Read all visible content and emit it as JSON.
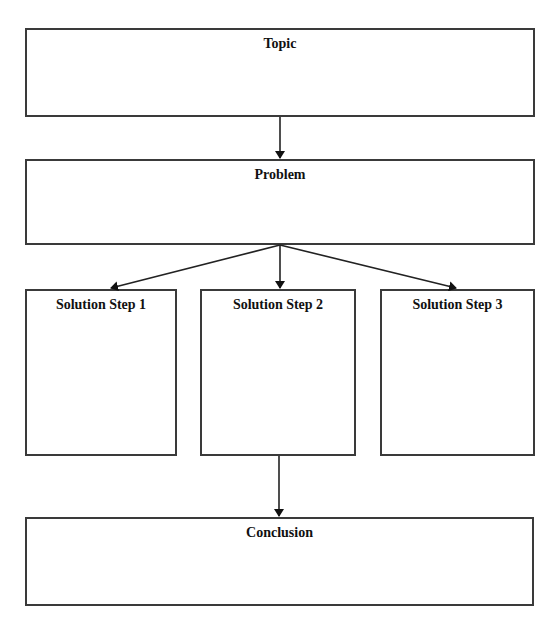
{
  "diagram": {
    "type": "flowchart",
    "colors": {
      "stroke": "#3a3a3a",
      "text": "#111111",
      "background": "#ffffff"
    },
    "nodes": [
      {
        "id": "topic",
        "label": "Topic",
        "x": 25,
        "y": 28,
        "w": 510,
        "h": 89
      },
      {
        "id": "problem",
        "label": "Problem",
        "x": 25,
        "y": 159,
        "w": 510,
        "h": 86
      },
      {
        "id": "step1",
        "label": "Solution Step 1",
        "x": 25,
        "y": 289,
        "w": 152,
        "h": 167
      },
      {
        "id": "step2",
        "label": "Solution Step 2",
        "x": 200,
        "y": 289,
        "w": 156,
        "h": 167
      },
      {
        "id": "step3",
        "label": "Solution Step 3",
        "x": 380,
        "y": 289,
        "w": 155,
        "h": 167
      },
      {
        "id": "conclusion",
        "label": "Conclusion",
        "x": 25,
        "y": 517,
        "w": 509,
        "h": 89
      }
    ],
    "edges": [
      {
        "from": "topic",
        "to": "problem",
        "x1": 280,
        "y1": 117,
        "x2": 280,
        "y2": 158
      },
      {
        "from": "problem",
        "to": "step1",
        "x1": 280,
        "y1": 245,
        "x2": 111,
        "y2": 288
      },
      {
        "from": "problem",
        "to": "step2",
        "x1": 280,
        "y1": 245,
        "x2": 280,
        "y2": 288
      },
      {
        "from": "problem",
        "to": "step3",
        "x1": 280,
        "y1": 245,
        "x2": 456,
        "y2": 288
      },
      {
        "from": "step2",
        "to": "conclusion",
        "x1": 279,
        "y1": 456,
        "x2": 279,
        "y2": 516
      }
    ]
  },
  "labels": {
    "topic": "Topic",
    "problem": "Problem",
    "step1": "Solution Step 1",
    "step2": "Solution Step 2",
    "step3": "Solution Step 3",
    "conclusion": "Conclusion"
  }
}
